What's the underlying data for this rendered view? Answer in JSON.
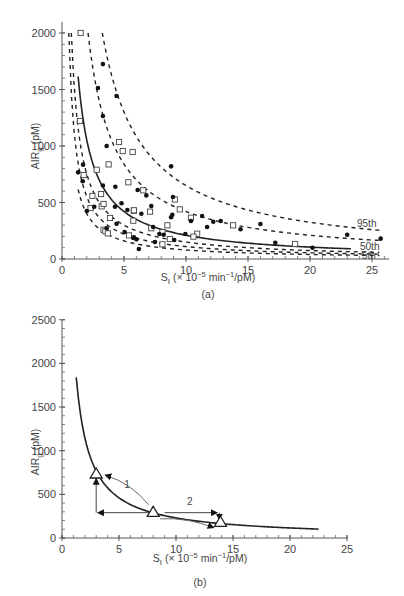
{
  "chart_data": [
    {
      "id": "a",
      "type": "scatter",
      "panel_label": "(a)",
      "title": "",
      "xlabel": "S_I (× 10^-5 min^-1/pM)",
      "ylabel": "AIR_g (pM)",
      "xlim": [
        0,
        26
      ],
      "ylim": [
        0,
        2000
      ],
      "xticks": [
        0,
        5,
        10,
        15,
        20,
        25
      ],
      "yticks": [
        0,
        500,
        1000,
        1500,
        2000
      ],
      "grid": false,
      "curves": [
        {
          "name": "95th",
          "style": "dashed",
          "k": 6500,
          "x_start": 3.25,
          "x_end": 25.6,
          "label": "95th"
        },
        {
          "name": "~80th",
          "style": "dashed",
          "k": 4200,
          "x_start": 2.1,
          "x_end": 25.6,
          "label": ""
        },
        {
          "name": "50th",
          "style": "solid",
          "k": 2100,
          "x_start": 1.3,
          "x_end": 23.3,
          "label": "50th"
        },
        {
          "name": "~25th",
          "style": "dashed",
          "k": 1500,
          "x_start": 0.75,
          "x_end": 25.6,
          "label": ""
        },
        {
          "name": "~15th",
          "style": "dashed",
          "k": 1100,
          "x_start": 0.55,
          "x_end": 25.6,
          "label": ""
        },
        {
          "name": "5th",
          "style": "dashed",
          "k": 800,
          "x_start": 1.3,
          "x_end": 25.6,
          "label": "5th"
        }
      ],
      "series": [
        {
          "name": "open squares",
          "marker": "square-open",
          "points": [
            [
              1.5,
              2000
            ],
            [
              1.45,
              1221
            ],
            [
              4.6,
              1035
            ],
            [
              4.9,
              955
            ],
            [
              5.7,
              947
            ],
            [
              1.75,
              743
            ],
            [
              2.8,
              790
            ],
            [
              3.76,
              837
            ],
            [
              5.35,
              679
            ],
            [
              2.45,
              558
            ],
            [
              3.15,
              575
            ],
            [
              2.3,
              451
            ],
            [
              3.2,
              466
            ],
            [
              3.35,
              487
            ],
            [
              5.8,
              427
            ],
            [
              3.87,
              363
            ],
            [
              3.35,
              259
            ],
            [
              3.5,
              245
            ],
            [
              3.7,
              227
            ],
            [
              5.4,
              209
            ],
            [
              6.55,
              608
            ],
            [
              9.1,
              527
            ],
            [
              9.5,
              439
            ],
            [
              5.8,
              431
            ],
            [
              7.1,
              419
            ],
            [
              5.75,
              339
            ],
            [
              10.4,
              365
            ],
            [
              8.5,
              298
            ],
            [
              7.2,
              272
            ],
            [
              8.1,
              239
            ],
            [
              10.9,
              224
            ],
            [
              10.6,
              198
            ],
            [
              8.7,
              177
            ],
            [
              8.1,
              130
            ],
            [
              13.8,
              298
            ],
            [
              18.8,
              133
            ]
          ]
        },
        {
          "name": "solid dots",
          "marker": "circle-filled",
          "points": [
            [
              3.3,
              1725
            ],
            [
              2.9,
              1513
            ],
            [
              4.4,
              1443
            ],
            [
              3.3,
              1265
            ],
            [
              3.6,
              1000
            ],
            [
              1.3,
              767
            ],
            [
              1.7,
              835
            ],
            [
              1.67,
              688
            ],
            [
              3.3,
              650
            ],
            [
              4.3,
              640
            ],
            [
              2.6,
              463
            ],
            [
              2.0,
              425
            ],
            [
              4.27,
              463
            ],
            [
              4.8,
              493
            ],
            [
              5.27,
              434
            ],
            [
              4.4,
              312
            ],
            [
              3.6,
              272
            ],
            [
              5.05,
              239
            ],
            [
              5.75,
              186
            ],
            [
              6.2,
              88
            ],
            [
              8.8,
              820
            ],
            [
              6.1,
              611
            ],
            [
              6.8,
              563
            ],
            [
              8.95,
              549
            ],
            [
              7.2,
              469
            ],
            [
              6.4,
              401
            ],
            [
              8.9,
              392
            ],
            [
              8.8,
              369
            ],
            [
              11.3,
              381
            ],
            [
              10.4,
              336
            ],
            [
              7.35,
              283
            ],
            [
              7.85,
              221
            ],
            [
              8.2,
              215
            ],
            [
              9.95,
              221
            ],
            [
              9.05,
              168
            ],
            [
              7.5,
              150
            ],
            [
              5.8,
              192
            ],
            [
              6.0,
              174
            ],
            [
              12.2,
              330
            ],
            [
              12.8,
              336
            ],
            [
              11.7,
              283
            ],
            [
              14.4,
              263
            ],
            [
              16.0,
              310
            ],
            [
              17.2,
              144
            ],
            [
              23.0,
              215
            ],
            [
              25.7,
              180
            ],
            [
              20.2,
              100
            ]
          ]
        }
      ]
    },
    {
      "id": "b",
      "type": "line",
      "panel_label": "(b)",
      "title": "",
      "xlabel": "S_I (× 10^-5 min^-1/pM)",
      "ylabel": "AIR_g (pM)",
      "xlim": [
        0,
        25
      ],
      "ylim": [
        0,
        2500
      ],
      "xticks": [
        0,
        5,
        10,
        15,
        20,
        25
      ],
      "yticks": [
        0,
        500,
        1000,
        1500,
        2000,
        2500
      ],
      "grid": false,
      "curve": {
        "name": "hyperbola",
        "style": "solid",
        "k": 2300,
        "x_start": 1.25,
        "x_end": 22.5
      },
      "markers": [
        {
          "label": "triangle-1",
          "x": 3.0,
          "y": 733
        },
        {
          "label": "triangle-2",
          "x": 8.0,
          "y": 294
        },
        {
          "label": "triangle-3",
          "x": 13.9,
          "y": 180
        }
      ],
      "annotations": [
        {
          "text": "1",
          "x": 5.7,
          "y": 570
        },
        {
          "text": "2",
          "x": 11.2,
          "y": 380
        }
      ],
      "arrows": [
        {
          "name": "up-arrow",
          "from": [
            3.0,
            290
          ],
          "to": [
            3.0,
            680
          ]
        },
        {
          "name": "left-arrow",
          "from": [
            8.0,
            290
          ],
          "to": [
            3.15,
            290
          ]
        },
        {
          "name": "right-arrow",
          "from": [
            9.0,
            290
          ],
          "to": [
            13.6,
            290
          ]
        },
        {
          "name": "down-arrow",
          "from": [
            13.8,
            290
          ],
          "to": [
            13.8,
            210
          ]
        },
        {
          "name": "arc-arrow-1",
          "from": [
            7.6,
            380
          ],
          "to": [
            3.8,
            720
          ],
          "curved": true
        },
        {
          "name": "arc-arrow-2",
          "from": [
            8.6,
            220
          ],
          "to": [
            13.3,
            118
          ],
          "curved": true
        }
      ]
    }
  ],
  "figure": {
    "panel_a_label": "(a)",
    "panel_b_label": "(b)",
    "ylabel_main": "AIR",
    "ylabel_sub": "g",
    "ylabel_unit": " (pM)",
    "xlabel_main": "S",
    "xlabel_sub": "I",
    "xlabel_rest": " (× 10",
    "xlabel_exp": "−5",
    "xlabel_unit": " min",
    "xlabel_exp2": "−1",
    "xlabel_end": "/pM)"
  }
}
